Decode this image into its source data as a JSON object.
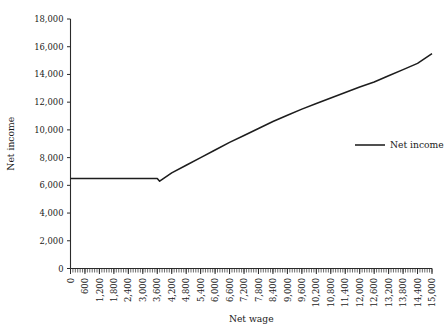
{
  "chart_data": {
    "type": "line",
    "title": "",
    "xlabel": "Net wage",
    "ylabel": "Net income",
    "xlim": [
      0,
      15000
    ],
    "ylim": [
      0,
      18000
    ],
    "grid": false,
    "legend_position": "right",
    "y_ticks": [
      0,
      2000,
      4000,
      6000,
      8000,
      10000,
      12000,
      14000,
      16000,
      18000
    ],
    "y_tick_labels": [
      "0",
      "2,000",
      "4,000",
      "6,000",
      "8,000",
      "10,000",
      "12,000",
      "14,000",
      "16,000",
      "18,000"
    ],
    "x_ticks": [
      0,
      600,
      1200,
      1800,
      2400,
      3000,
      3600,
      4200,
      4800,
      5400,
      6000,
      6600,
      7200,
      7800,
      8400,
      9000,
      9600,
      10200,
      10800,
      11400,
      12000,
      12600,
      13200,
      13800,
      14400,
      15000
    ],
    "x_tick_labels": [
      "0",
      "600",
      "1,200",
      "1,800",
      "2,400",
      "3,000",
      "3,600",
      "4,200",
      "4,800",
      "5,400",
      "6,000",
      "6,600",
      "7,200",
      "7,800",
      "8,400",
      "9,000",
      "9,600",
      "10,200",
      "10,800",
      "11,400",
      "12,000",
      "12,600",
      "13,200",
      "13,800",
      "14,400",
      "15,000"
    ],
    "x_minor_tick_step": 100,
    "series": [
      {
        "name": "Net income",
        "color": "#1d1d1d",
        "x": [
          0,
          600,
          1200,
          1800,
          2400,
          3000,
          3400,
          3600,
          3700,
          4200,
          4800,
          5400,
          6000,
          6600,
          7200,
          7800,
          8400,
          9000,
          9600,
          10200,
          10800,
          11400,
          12000,
          12600,
          13200,
          13800,
          14400,
          15000
        ],
        "values": [
          6500,
          6500,
          6500,
          6500,
          6500,
          6500,
          6500,
          6500,
          6300,
          6900,
          7450,
          8000,
          8550,
          9100,
          9600,
          10100,
          10600,
          11050,
          11500,
          11900,
          12300,
          12700,
          13100,
          13450,
          13900,
          14350,
          14800,
          15500
        ]
      }
    ]
  },
  "legend": {
    "entries": [
      {
        "label": "Net income"
      }
    ]
  },
  "axes": {
    "x_title": "Net wage",
    "y_title": "Net income"
  }
}
